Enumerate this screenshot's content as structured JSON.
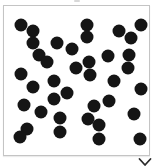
{
  "panel": {
    "type": "image-tile",
    "frame_color": "#c4c4c4",
    "dot_color": "#151515",
    "dot_radius": 6.5,
    "dots": [
      [
        20,
        24
      ],
      [
        32,
        30
      ],
      [
        32,
        42
      ],
      [
        38,
        54
      ],
      [
        46,
        61
      ],
      [
        56,
        42
      ],
      [
        71,
        48
      ],
      [
        86,
        24
      ],
      [
        86,
        36
      ],
      [
        118,
        30
      ],
      [
        130,
        37
      ],
      [
        140,
        24
      ],
      [
        107,
        55
      ],
      [
        128,
        54
      ],
      [
        127,
        67
      ],
      [
        20,
        73
      ],
      [
        32,
        86
      ],
      [
        53,
        80
      ],
      [
        75,
        67
      ],
      [
        88,
        61
      ],
      [
        89,
        74
      ],
      [
        113,
        80
      ],
      [
        140,
        88
      ],
      [
        66,
        92
      ],
      [
        53,
        98
      ],
      [
        23,
        104
      ],
      [
        40,
        111
      ],
      [
        93,
        105
      ],
      [
        108,
        100
      ],
      [
        87,
        118
      ],
      [
        98,
        124
      ],
      [
        59,
        117
      ],
      [
        59,
        131
      ],
      [
        133,
        113
      ],
      [
        26,
        128
      ],
      [
        19,
        136
      ],
      [
        98,
        138
      ],
      [
        139,
        138
      ]
    ]
  },
  "controls": {
    "expand_icon": "chevron-down-icon"
  }
}
